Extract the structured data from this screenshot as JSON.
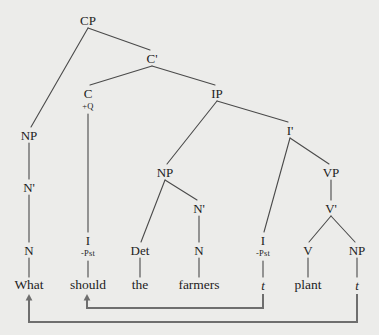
{
  "diagram": {
    "sentence": "What should the farmers plant",
    "width": 379,
    "height": 335,
    "background_color": "#ececea",
    "line_color": "#4a4a4a",
    "arrow_color": "#6e6e6e",
    "text_color": "#1d1d1d"
  },
  "nodes": [
    {
      "id": "cp",
      "label": "CP",
      "x": 88,
      "y": 20,
      "kind": "cat"
    },
    {
      "id": "cbar",
      "label": "C'",
      "x": 152,
      "y": 58,
      "kind": "cat"
    },
    {
      "id": "c",
      "label": "C",
      "x": 88,
      "y": 93,
      "kind": "cat"
    },
    {
      "id": "cq",
      "label": "+Q",
      "x": 88,
      "y": 106,
      "kind": "feat"
    },
    {
      "id": "ip",
      "label": "IP",
      "x": 217,
      "y": 93,
      "kind": "cat"
    },
    {
      "id": "np-wh",
      "label": "NP",
      "x": 29,
      "y": 135,
      "kind": "cat"
    },
    {
      "id": "ibar",
      "label": "I'",
      "x": 290,
      "y": 130,
      "kind": "cat"
    },
    {
      "id": "nbar-wh",
      "label": "N'",
      "x": 29,
      "y": 187,
      "kind": "cat"
    },
    {
      "id": "np-subj",
      "label": "NP",
      "x": 165,
      "y": 172,
      "kind": "cat"
    },
    {
      "id": "vp",
      "label": "VP",
      "x": 331,
      "y": 172,
      "kind": "cat"
    },
    {
      "id": "nbar-subj",
      "label": "N'",
      "x": 199,
      "y": 208,
      "kind": "cat"
    },
    {
      "id": "vbar",
      "label": "V'",
      "x": 331,
      "y": 208,
      "kind": "cat"
    },
    {
      "id": "n-wh",
      "label": "N",
      "x": 29,
      "y": 250,
      "kind": "cat"
    },
    {
      "id": "i-aux",
      "label": "I",
      "x": 88,
      "y": 240,
      "kind": "cat"
    },
    {
      "id": "i-aux-pst",
      "label": "-Pst",
      "x": 88,
      "y": 253,
      "kind": "feat"
    },
    {
      "id": "det",
      "label": "Det",
      "x": 140,
      "y": 250,
      "kind": "cat"
    },
    {
      "id": "n-subj",
      "label": "N",
      "x": 199,
      "y": 250,
      "kind": "cat"
    },
    {
      "id": "i-trace",
      "label": "I",
      "x": 263,
      "y": 240,
      "kind": "cat"
    },
    {
      "id": "i-trace-pst",
      "label": "-Pst",
      "x": 263,
      "y": 253,
      "kind": "feat"
    },
    {
      "id": "v",
      "label": "V",
      "x": 308,
      "y": 250,
      "kind": "cat"
    },
    {
      "id": "np-obj",
      "label": "NP",
      "x": 357,
      "y": 250,
      "kind": "cat"
    }
  ],
  "terminals": [
    {
      "id": "w-what",
      "label": "What",
      "x": 29,
      "y": 285,
      "kind": "word"
    },
    {
      "id": "w-should",
      "label": "should",
      "x": 88,
      "y": 285,
      "kind": "word"
    },
    {
      "id": "w-the",
      "label": "the",
      "x": 140,
      "y": 285,
      "kind": "word"
    },
    {
      "id": "w-farmers",
      "label": "farmers",
      "x": 199,
      "y": 285,
      "kind": "word"
    },
    {
      "id": "w-trace-i",
      "label": "t",
      "x": 263,
      "y": 285,
      "kind": "trace"
    },
    {
      "id": "w-plant",
      "label": "plant",
      "x": 308,
      "y": 285,
      "kind": "word"
    },
    {
      "id": "w-trace-np",
      "label": "t",
      "x": 357,
      "y": 285,
      "kind": "trace"
    }
  ],
  "edges": [
    {
      "from": "cp",
      "to": "np-wh",
      "x1": 88,
      "y1": 28,
      "x2": 31,
      "y2": 127
    },
    {
      "from": "cp",
      "to": "cbar",
      "x1": 88,
      "y1": 28,
      "x2": 150,
      "y2": 50
    },
    {
      "from": "cbar",
      "to": "c",
      "x1": 152,
      "y1": 66,
      "x2": 90,
      "y2": 85
    },
    {
      "from": "cbar",
      "to": "ip",
      "x1": 152,
      "y1": 66,
      "x2": 215,
      "y2": 85
    },
    {
      "from": "c",
      "to": "i-aux",
      "x1": 88,
      "y1": 114,
      "x2": 88,
      "y2": 232
    },
    {
      "from": "ip",
      "to": "np-subj",
      "x1": 217,
      "y1": 101,
      "x2": 167,
      "y2": 164
    },
    {
      "from": "ip",
      "to": "ibar",
      "x1": 217,
      "y1": 101,
      "x2": 288,
      "y2": 122
    },
    {
      "from": "np-wh",
      "to": "nbar-wh",
      "x1": 29,
      "y1": 143,
      "x2": 29,
      "y2": 179
    },
    {
      "from": "nbar-wh",
      "to": "n-wh",
      "x1": 29,
      "y1": 195,
      "x2": 29,
      "y2": 242
    },
    {
      "from": "n-wh",
      "to": "w-what",
      "x1": 29,
      "y1": 258,
      "x2": 29,
      "y2": 277
    },
    {
      "from": "ibar",
      "to": "i-trace",
      "x1": 290,
      "y1": 138,
      "x2": 264,
      "y2": 232
    },
    {
      "from": "ibar",
      "to": "vp",
      "x1": 290,
      "y1": 138,
      "x2": 329,
      "y2": 164
    },
    {
      "from": "np-subj",
      "to": "det",
      "x1": 165,
      "y1": 180,
      "x2": 141,
      "y2": 242
    },
    {
      "from": "np-subj",
      "to": "nbar-subj",
      "x1": 165,
      "y1": 180,
      "x2": 197,
      "y2": 200
    },
    {
      "from": "nbar-subj",
      "to": "n-subj",
      "x1": 199,
      "y1": 216,
      "x2": 199,
      "y2": 242
    },
    {
      "from": "vp",
      "to": "vbar",
      "x1": 331,
      "y1": 180,
      "x2": 331,
      "y2": 200
    },
    {
      "from": "vbar",
      "to": "v",
      "x1": 331,
      "y1": 216,
      "x2": 309,
      "y2": 242
    },
    {
      "from": "vbar",
      "to": "np-obj",
      "x1": 331,
      "y1": 216,
      "x2": 355,
      "y2": 242
    },
    {
      "from": "i-aux",
      "to": "w-should",
      "x1": 88,
      "y1": 261,
      "x2": 88,
      "y2": 277
    },
    {
      "from": "det",
      "to": "w-the",
      "x1": 140,
      "y1": 258,
      "x2": 140,
      "y2": 277
    },
    {
      "from": "n-subj",
      "to": "w-farmers",
      "x1": 199,
      "y1": 258,
      "x2": 199,
      "y2": 277
    },
    {
      "from": "i-trace",
      "to": "w-trace-i",
      "x1": 263,
      "y1": 261,
      "x2": 263,
      "y2": 277
    },
    {
      "from": "v",
      "to": "w-plant",
      "x1": 308,
      "y1": 258,
      "x2": 308,
      "y2": 277
    },
    {
      "from": "np-obj",
      "to": "w-trace-np",
      "x1": 357,
      "y1": 258,
      "x2": 357,
      "y2": 277
    }
  ],
  "movement_arrows": [
    {
      "id": "head-movement",
      "description": "I-to-C head movement from trace to should",
      "path": "M 263 294 L 263 308 L 87 308 L 87 298",
      "arrowhead_x": 87,
      "arrowhead_y": 294
    },
    {
      "id": "wh-movement",
      "description": "wh-movement of object NP to specifier of CP",
      "path": "M 357 294 L 357 322 L 29 322 L 29 298",
      "arrowhead_x": 29,
      "arrowhead_y": 294
    }
  ]
}
